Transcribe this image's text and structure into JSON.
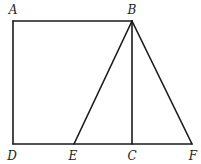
{
  "diagram": {
    "type": "geometry",
    "stroke_color": "#1a1a1a",
    "background": "#ffffff",
    "points": {
      "A": {
        "label": "A",
        "x": 13,
        "y": 21,
        "lx": 13,
        "ly": 14
      },
      "B": {
        "label": "B",
        "x": 132,
        "y": 21,
        "lx": 132,
        "ly": 14
      },
      "C": {
        "label": "C",
        "x": 132,
        "y": 144,
        "lx": 132,
        "ly": 160
      },
      "D": {
        "label": "D",
        "x": 13,
        "y": 144,
        "lx": 12,
        "ly": 160
      },
      "E": {
        "label": "E",
        "x": 74,
        "y": 144,
        "lx": 73,
        "ly": 160
      },
      "F": {
        "label": "F",
        "x": 192,
        "y": 144,
        "lx": 193,
        "ly": 160
      }
    },
    "segments": [
      [
        "A",
        "B"
      ],
      [
        "A",
        "D"
      ],
      [
        "D",
        "F"
      ],
      [
        "B",
        "C"
      ],
      [
        "B",
        "E"
      ],
      [
        "B",
        "F"
      ]
    ]
  }
}
